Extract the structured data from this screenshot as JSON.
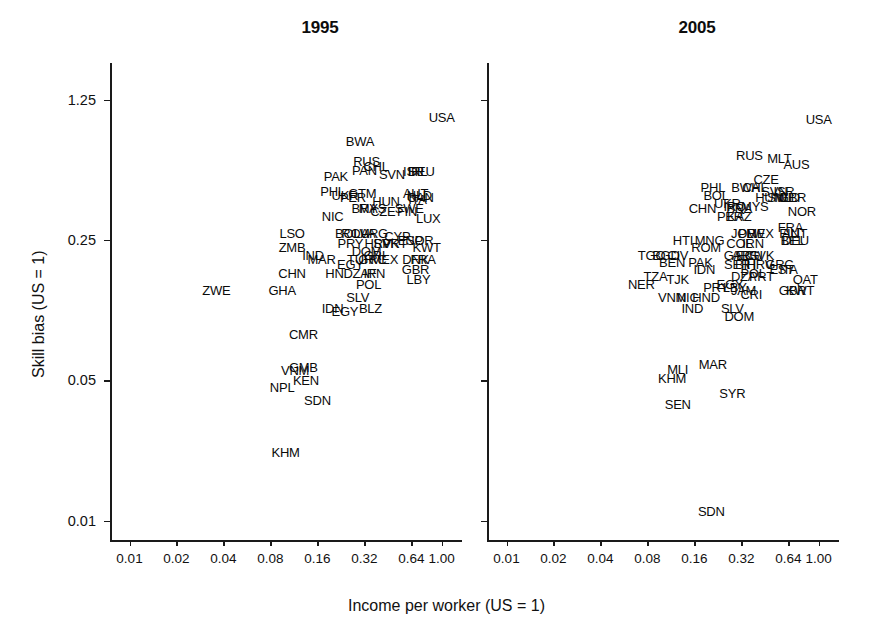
{
  "figure": {
    "axis_label_x": "Income per worker (US = 1)",
    "axis_label_y": "Skill bias (US = 1)",
    "text_color": "#0a0a0a",
    "axis_color": "#1a1a1a",
    "background": "#ffffff"
  },
  "chart_data": {
    "type": "scatter",
    "title": "",
    "xlabel": "Income per worker (US = 1)",
    "ylabel": "Skill bias (US = 1)",
    "xscale": "log",
    "yscale": "log",
    "grid": false,
    "legend": "none",
    "marker": "country-code-text-label",
    "xticks": [
      0.01,
      0.02,
      0.04,
      0.08,
      0.16,
      0.32,
      0.64,
      1.0
    ],
    "xticklabels": [
      "0.01",
      "0.02",
      "0.04",
      "0.08",
      "0.16",
      "0.32",
      "0.64",
      "1.00"
    ],
    "yticks": [
      0.01,
      0.05,
      0.25,
      1.25
    ],
    "yticklabels": [
      "0.01",
      "0.05",
      "0.25",
      "1.25"
    ],
    "xlim": [
      0.0075,
      1.35
    ],
    "ylim": [
      0.008,
      1.9
    ],
    "panels": [
      {
        "label": "1995",
        "points": [
          {
            "code": "USA",
            "x": 1.0,
            "y": 1.02
          },
          {
            "code": "BWA",
            "x": 0.3,
            "y": 0.78
          },
          {
            "code": "RUS",
            "x": 0.33,
            "y": 0.62
          },
          {
            "code": "PAN",
            "x": 0.32,
            "y": 0.56
          },
          {
            "code": "CHL",
            "x": 0.38,
            "y": 0.58
          },
          {
            "code": "SVN",
            "x": 0.48,
            "y": 0.53
          },
          {
            "code": "ISR",
            "x": 0.66,
            "y": 0.55
          },
          {
            "code": "IRL",
            "x": 0.7,
            "y": 0.55
          },
          {
            "code": "DEU",
            "x": 0.74,
            "y": 0.55
          },
          {
            "code": "PAK",
            "x": 0.21,
            "y": 0.52
          },
          {
            "code": "PHL",
            "x": 0.2,
            "y": 0.44
          },
          {
            "code": "UKR",
            "x": 0.24,
            "y": 0.42
          },
          {
            "code": "PER",
            "x": 0.27,
            "y": 0.41
          },
          {
            "code": "GTM",
            "x": 0.31,
            "y": 0.43
          },
          {
            "code": "HUN",
            "x": 0.44,
            "y": 0.39
          },
          {
            "code": "AUT",
            "x": 0.68,
            "y": 0.43
          },
          {
            "code": "NLD",
            "x": 0.72,
            "y": 0.42
          },
          {
            "code": "ITA",
            "x": 0.7,
            "y": 0.4
          },
          {
            "code": "CAN",
            "x": 0.73,
            "y": 0.41
          },
          {
            "code": "BRA",
            "x": 0.32,
            "y": 0.36
          },
          {
            "code": "MYS",
            "x": 0.36,
            "y": 0.36
          },
          {
            "code": "CZE",
            "x": 0.42,
            "y": 0.35
          },
          {
            "code": "SWE",
            "x": 0.62,
            "y": 0.36
          },
          {
            "code": "FIN",
            "x": 0.6,
            "y": 0.35
          },
          {
            "code": "NIC",
            "x": 0.2,
            "y": 0.33
          },
          {
            "code": "LUX",
            "x": 0.82,
            "y": 0.32
          },
          {
            "code": "LSO",
            "x": 0.11,
            "y": 0.27
          },
          {
            "code": "ZMB",
            "x": 0.11,
            "y": 0.23
          },
          {
            "code": "BOL",
            "x": 0.25,
            "y": 0.27
          },
          {
            "code": "ROU",
            "x": 0.28,
            "y": 0.27
          },
          {
            "code": "LVA",
            "x": 0.32,
            "y": 0.27
          },
          {
            "code": "ARG",
            "x": 0.37,
            "y": 0.27
          },
          {
            "code": "CYP",
            "x": 0.52,
            "y": 0.26
          },
          {
            "code": "ESP",
            "x": 0.63,
            "y": 0.25
          },
          {
            "code": "NOR",
            "x": 0.72,
            "y": 0.25
          },
          {
            "code": "KWT",
            "x": 0.8,
            "y": 0.23
          },
          {
            "code": "PRY",
            "x": 0.26,
            "y": 0.24
          },
          {
            "code": "HRV",
            "x": 0.39,
            "y": 0.24
          },
          {
            "code": "SVK",
            "x": 0.44,
            "y": 0.24
          },
          {
            "code": "PRT",
            "x": 0.5,
            "y": 0.24
          },
          {
            "code": "IND",
            "x": 0.15,
            "y": 0.21
          },
          {
            "code": "MAR",
            "x": 0.17,
            "y": 0.2
          },
          {
            "code": "DOM",
            "x": 0.33,
            "y": 0.22
          },
          {
            "code": "CRI",
            "x": 0.37,
            "y": 0.21
          },
          {
            "code": "TUR",
            "x": 0.3,
            "y": 0.2
          },
          {
            "code": "EGY",
            "x": 0.26,
            "y": 0.19
          },
          {
            "code": "GRC",
            "x": 0.36,
            "y": 0.2
          },
          {
            "code": "MEX",
            "x": 0.43,
            "y": 0.2
          },
          {
            "code": "DNK",
            "x": 0.68,
            "y": 0.2
          },
          {
            "code": "FRA",
            "x": 0.76,
            "y": 0.2
          },
          {
            "code": "GBR",
            "x": 0.68,
            "y": 0.18
          },
          {
            "code": "CHN",
            "x": 0.11,
            "y": 0.17
          },
          {
            "code": "HND",
            "x": 0.22,
            "y": 0.17
          },
          {
            "code": "ZAF",
            "x": 0.32,
            "y": 0.17
          },
          {
            "code": "IRN",
            "x": 0.37,
            "y": 0.17
          },
          {
            "code": "LBY",
            "x": 0.71,
            "y": 0.16
          },
          {
            "code": "POL",
            "x": 0.34,
            "y": 0.15
          },
          {
            "code": "ZWE",
            "x": 0.036,
            "y": 0.14
          },
          {
            "code": "GHA",
            "x": 0.095,
            "y": 0.14
          },
          {
            "code": "SLV",
            "x": 0.29,
            "y": 0.13
          },
          {
            "code": "IDN",
            "x": 0.2,
            "y": 0.115
          },
          {
            "code": "EGY2",
            "x": 0.24,
            "y": 0.11
          },
          {
            "code": "BLZ",
            "x": 0.35,
            "y": 0.115
          },
          {
            "code": "CMR",
            "x": 0.13,
            "y": 0.085
          },
          {
            "code": "VNM",
            "x": 0.115,
            "y": 0.056
          },
          {
            "code": "GMB",
            "x": 0.13,
            "y": 0.058
          },
          {
            "code": "KEN",
            "x": 0.135,
            "y": 0.05
          },
          {
            "code": "NPL",
            "x": 0.095,
            "y": 0.046
          },
          {
            "code": "SDN",
            "x": 0.16,
            "y": 0.04
          },
          {
            "code": "KHM",
            "x": 0.1,
            "y": 0.022
          }
        ]
      },
      {
        "label": "2005",
        "points": [
          {
            "code": "USA",
            "x": 1.0,
            "y": 1.0
          },
          {
            "code": "RUS",
            "x": 0.36,
            "y": 0.66
          },
          {
            "code": "MLT",
            "x": 0.56,
            "y": 0.64
          },
          {
            "code": "AUS",
            "x": 0.72,
            "y": 0.6
          },
          {
            "code": "CZE",
            "x": 0.46,
            "y": 0.5
          },
          {
            "code": "PHL",
            "x": 0.21,
            "y": 0.46
          },
          {
            "code": "BWA",
            "x": 0.34,
            "y": 0.46
          },
          {
            "code": "CHL",
            "x": 0.39,
            "y": 0.46
          },
          {
            "code": "SVN",
            "x": 0.52,
            "y": 0.44
          },
          {
            "code": "ISR",
            "x": 0.6,
            "y": 0.44
          },
          {
            "code": "BOL",
            "x": 0.22,
            "y": 0.42
          },
          {
            "code": "HUN",
            "x": 0.48,
            "y": 0.41
          },
          {
            "code": "SWE",
            "x": 0.58,
            "y": 0.41
          },
          {
            "code": "NLD",
            "x": 0.63,
            "y": 0.41
          },
          {
            "code": "GBR2",
            "x": 0.68,
            "y": 0.41
          },
          {
            "code": "UKR",
            "x": 0.26,
            "y": 0.38
          },
          {
            "code": "CHN",
            "x": 0.18,
            "y": 0.36
          },
          {
            "code": "IRQ",
            "x": 0.29,
            "y": 0.37
          },
          {
            "code": "BRA",
            "x": 0.31,
            "y": 0.36
          },
          {
            "code": "MYS",
            "x": 0.39,
            "y": 0.37
          },
          {
            "code": "NOR",
            "x": 0.78,
            "y": 0.35
          },
          {
            "code": "PER",
            "x": 0.27,
            "y": 0.33
          },
          {
            "code": "KAZ",
            "x": 0.31,
            "y": 0.33
          },
          {
            "code": "FRA",
            "x": 0.66,
            "y": 0.29
          },
          {
            "code": "FIN",
            "x": 0.65,
            "y": 0.27
          },
          {
            "code": "AUT",
            "x": 0.7,
            "y": 0.27
          },
          {
            "code": "JOR",
            "x": 0.33,
            "y": 0.27
          },
          {
            "code": "PLW",
            "x": 0.37,
            "y": 0.27
          },
          {
            "code": "MEX",
            "x": 0.42,
            "y": 0.27
          },
          {
            "code": "BEL",
            "x": 0.68,
            "y": 0.25
          },
          {
            "code": "DEU",
            "x": 0.71,
            "y": 0.25
          },
          {
            "code": "HTI",
            "x": 0.135,
            "y": 0.25
          },
          {
            "code": "MNG",
            "x": 0.2,
            "y": 0.25
          },
          {
            "code": "COL",
            "x": 0.31,
            "y": 0.24
          },
          {
            "code": "IRN",
            "x": 0.38,
            "y": 0.24
          },
          {
            "code": "ROM",
            "x": 0.19,
            "y": 0.23
          },
          {
            "code": "TGO",
            "x": 0.085,
            "y": 0.21
          },
          {
            "code": "BGD",
            "x": 0.105,
            "y": 0.21
          },
          {
            "code": "CIV",
            "x": 0.125,
            "y": 0.21
          },
          {
            "code": "GAB",
            "x": 0.3,
            "y": 0.21
          },
          {
            "code": "ARG",
            "x": 0.34,
            "y": 0.21
          },
          {
            "code": "ECU",
            "x": 0.36,
            "y": 0.21
          },
          {
            "code": "SVK",
            "x": 0.43,
            "y": 0.21
          },
          {
            "code": "BEN",
            "x": 0.115,
            "y": 0.195
          },
          {
            "code": "PAK",
            "x": 0.175,
            "y": 0.195
          },
          {
            "code": "SER",
            "x": 0.3,
            "y": 0.19
          },
          {
            "code": "BIH",
            "x": 0.34,
            "y": 0.19
          },
          {
            "code": "HRV",
            "x": 0.42,
            "y": 0.19
          },
          {
            "code": "GRC",
            "x": 0.56,
            "y": 0.19
          },
          {
            "code": "EST",
            "x": 0.58,
            "y": 0.18
          },
          {
            "code": "ITA",
            "x": 0.64,
            "y": 0.18
          },
          {
            "code": "IDN",
            "x": 0.185,
            "y": 0.18
          },
          {
            "code": "TZA",
            "x": 0.09,
            "y": 0.165
          },
          {
            "code": "TJK",
            "x": 0.125,
            "y": 0.16
          },
          {
            "code": "DZA",
            "x": 0.33,
            "y": 0.165
          },
          {
            "code": "POL",
            "x": 0.38,
            "y": 0.17
          },
          {
            "code": "PRT",
            "x": 0.43,
            "y": 0.165
          },
          {
            "code": "QAT",
            "x": 0.82,
            "y": 0.16
          },
          {
            "code": "NER",
            "x": 0.073,
            "y": 0.15
          },
          {
            "code": "PRY",
            "x": 0.22,
            "y": 0.145
          },
          {
            "code": "EGY",
            "x": 0.27,
            "y": 0.15
          },
          {
            "code": "LBY",
            "x": 0.29,
            "y": 0.145
          },
          {
            "code": "JAM",
            "x": 0.33,
            "y": 0.14
          },
          {
            "code": "CRI",
            "x": 0.37,
            "y": 0.135
          },
          {
            "code": "GBR",
            "x": 0.68,
            "y": 0.14
          },
          {
            "code": "KWT",
            "x": 0.76,
            "y": 0.14
          },
          {
            "code": "VNM",
            "x": 0.115,
            "y": 0.13
          },
          {
            "code": "NIC",
            "x": 0.145,
            "y": 0.13
          },
          {
            "code": "HND",
            "x": 0.19,
            "y": 0.13
          },
          {
            "code": "IND",
            "x": 0.155,
            "y": 0.115
          },
          {
            "code": "SLV",
            "x": 0.28,
            "y": 0.115
          },
          {
            "code": "DOM",
            "x": 0.31,
            "y": 0.105
          },
          {
            "code": "MAR",
            "x": 0.21,
            "y": 0.06
          },
          {
            "code": "MLI",
            "x": 0.125,
            "y": 0.057
          },
          {
            "code": "KHM",
            "x": 0.115,
            "y": 0.051
          },
          {
            "code": "SYR",
            "x": 0.28,
            "y": 0.043
          },
          {
            "code": "SEN",
            "x": 0.125,
            "y": 0.038
          },
          {
            "code": "SDN",
            "x": 0.205,
            "y": 0.0112
          }
        ]
      }
    ]
  }
}
